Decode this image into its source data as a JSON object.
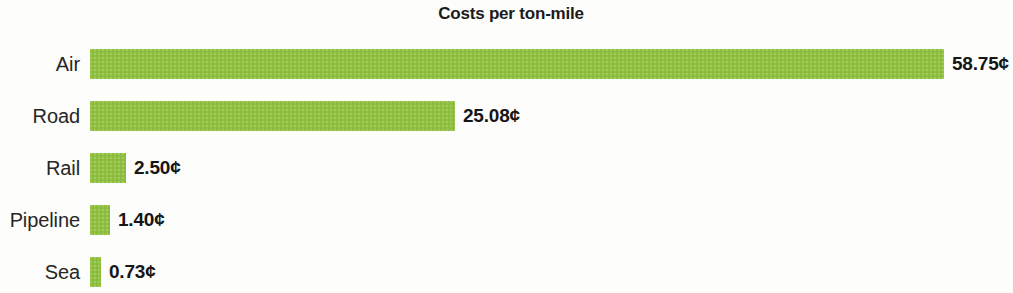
{
  "chart_data": {
    "type": "bar",
    "orientation": "horizontal",
    "title": "Costs per ton-mile",
    "xlabel": "",
    "ylabel": "",
    "unit": "¢",
    "grid": false,
    "legend": null,
    "xlim": [
      0,
      58.75
    ],
    "categories": [
      "Air",
      "Road",
      "Rail",
      "Pipeline",
      "Sea"
    ],
    "values": [
      58.75,
      25.08,
      2.5,
      1.4,
      0.73
    ],
    "value_labels": [
      "58.75¢",
      "25.08¢",
      "2.50¢",
      "1.40¢",
      "0.73¢"
    ],
    "bar_color": "#8fbf3f",
    "text_color": "#1b1b1b",
    "background_color": "#fdfdfb",
    "bars": [
      {
        "category": "Air",
        "value": 58.75,
        "label": "58.75¢",
        "pct": 100.0
      },
      {
        "category": "Road",
        "value": 25.08,
        "label": "25.08¢",
        "pct": 42.69
      },
      {
        "category": "Rail",
        "value": 2.5,
        "label": "2.50¢",
        "pct": 4.26
      },
      {
        "category": "Pipeline",
        "value": 1.4,
        "label": "1.40¢",
        "pct": 2.38
      },
      {
        "category": "Sea",
        "value": 0.73,
        "label": "0.73¢",
        "pct": 1.24
      }
    ]
  }
}
